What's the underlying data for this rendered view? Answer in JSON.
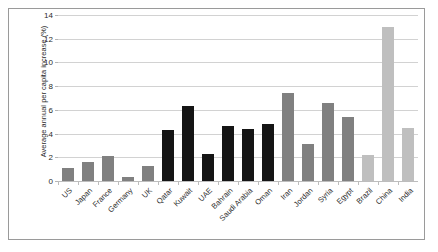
{
  "chart_data": {
    "type": "bar",
    "title": "",
    "xlabel": "",
    "ylabel": "Average annual per capita increase (%)",
    "ylim": [
      0,
      14
    ],
    "yticks": [
      0,
      2,
      4,
      6,
      8,
      10,
      12,
      14
    ],
    "ytick_labels": [
      "0",
      "2",
      "4",
      "6",
      "8",
      "10",
      "12",
      "14"
    ],
    "grid": true,
    "legend": "none",
    "categories": [
      "US",
      "Japan",
      "France",
      "Germany",
      "UK",
      "Qatar",
      "Kuwait",
      "UAE",
      "Bahrain",
      "Saudi Arabia",
      "Oman",
      "Iran",
      "Jordan",
      "Syria",
      "Egypt",
      "Brazil",
      "China",
      "India"
    ],
    "values": [
      1.1,
      1.6,
      2.1,
      0.3,
      1.3,
      4.3,
      6.3,
      2.3,
      4.6,
      4.4,
      4.8,
      7.4,
      3.1,
      6.6,
      5.4,
      2.2,
      13.0,
      4.5
    ],
    "bar_colors": [
      "#808080",
      "#808080",
      "#808080",
      "#808080",
      "#808080",
      "#151515",
      "#151515",
      "#151515",
      "#151515",
      "#151515",
      "#151515",
      "#808080",
      "#808080",
      "#808080",
      "#808080",
      "#bfbfbf",
      "#bfbfbf",
      "#bfbfbf"
    ],
    "colors": {
      "gridline": "#d2d2d2",
      "axis": "#bdbdbd",
      "text": "#2b2b2b",
      "frame": "#9a9a9a",
      "background": "#ffffff"
    }
  }
}
